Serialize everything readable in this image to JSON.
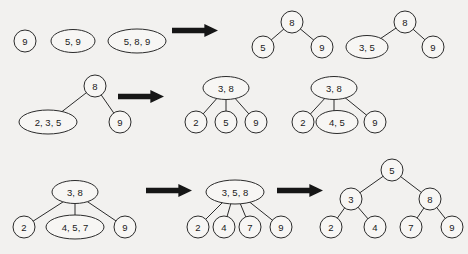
{
  "diagram": {
    "background_color": "#f2f1ef",
    "stroke_color": "#2b2b2b",
    "arrow_color": "#161616",
    "rows": [
      {
        "name": "row-1",
        "steps": [
          {
            "name": "step-1-a",
            "nodes": [
              {
                "label": "9",
                "cx": 25,
                "cy": 41,
                "rx": 11,
                "ry": 11
              }
            ],
            "edges": []
          },
          {
            "name": "step-1-b",
            "nodes": [
              {
                "label": "5, 9",
                "cx": 73,
                "cy": 41,
                "rx": 22,
                "ry": 11.5
              }
            ],
            "edges": []
          },
          {
            "name": "step-1-c",
            "nodes": [
              {
                "label": "5, 8, 9",
                "cx": 137,
                "cy": 41,
                "rx": 29,
                "ry": 12
              }
            ],
            "edges": []
          },
          {
            "name": "step-1-d",
            "nodes": [
              {
                "label": "8",
                "cx": 292,
                "cy": 22,
                "rx": 11,
                "ry": 11
              },
              {
                "label": "5",
                "cx": 263,
                "cy": 47,
                "rx": 11,
                "ry": 11
              },
              {
                "label": "9",
                "cx": 322,
                "cy": 47,
                "rx": 11,
                "ry": 11
              }
            ],
            "edges": [
              {
                "x1": 292,
                "y1": 22,
                "x2": 263,
                "y2": 47
              },
              {
                "x1": 292,
                "y1": 22,
                "x2": 322,
                "y2": 47
              }
            ]
          },
          {
            "name": "step-1-e",
            "nodes": [
              {
                "label": "8",
                "cx": 405,
                "cy": 22,
                "rx": 11,
                "ry": 11
              },
              {
                "label": "3, 5",
                "cx": 367,
                "cy": 47,
                "rx": 21,
                "ry": 11.5
              },
              {
                "label": "9",
                "cx": 433,
                "cy": 47,
                "rx": 11,
                "ry": 11
              }
            ],
            "edges": [
              {
                "x1": 405,
                "y1": 22,
                "x2": 371,
                "y2": 45
              },
              {
                "x1": 405,
                "y1": 22,
                "x2": 433,
                "y2": 47
              }
            ]
          }
        ],
        "arrows": [
          {
            "name": "arrow-row1",
            "x": 172,
            "y": 24,
            "w": 46,
            "h": 13
          }
        ]
      },
      {
        "name": "row-2",
        "steps": [
          {
            "name": "step-2-a",
            "nodes": [
              {
                "label": "8",
                "cx": 95,
                "cy": 86,
                "rx": 11,
                "ry": 11
              },
              {
                "label": "2, 3, 5",
                "cx": 48,
                "cy": 122,
                "rx": 29,
                "ry": 12
              },
              {
                "label": "9",
                "cx": 120,
                "cy": 122,
                "rx": 11,
                "ry": 11
              }
            ],
            "edges": [
              {
                "x1": 95,
                "y1": 86,
                "x2": 55,
                "y2": 117
              },
              {
                "x1": 95,
                "y1": 86,
                "x2": 120,
                "y2": 122
              }
            ]
          },
          {
            "name": "step-2-b",
            "nodes": [
              {
                "label": "3, 8",
                "cx": 226,
                "cy": 88,
                "rx": 23,
                "ry": 11.5
              },
              {
                "label": "2",
                "cx": 196,
                "cy": 122,
                "rx": 11,
                "ry": 11
              },
              {
                "label": "5",
                "cx": 226,
                "cy": 122,
                "rx": 11,
                "ry": 11
              },
              {
                "label": "9",
                "cx": 256,
                "cy": 122,
                "rx": 11,
                "ry": 11
              }
            ],
            "edges": [
              {
                "x1": 219,
                "y1": 96,
                "x2": 196,
                "y2": 122
              },
              {
                "x1": 226,
                "y1": 99,
                "x2": 226,
                "y2": 122
              },
              {
                "x1": 233,
                "y1": 96,
                "x2": 256,
                "y2": 122
              }
            ]
          },
          {
            "name": "step-2-c",
            "nodes": [
              {
                "label": "3, 8",
                "cx": 334,
                "cy": 88,
                "rx": 23,
                "ry": 11.5
              },
              {
                "label": "2",
                "cx": 303,
                "cy": 122,
                "rx": 11,
                "ry": 11
              },
              {
                "label": "4, 5",
                "cx": 337,
                "cy": 122,
                "rx": 21,
                "ry": 11.5
              },
              {
                "label": "9",
                "cx": 375,
                "cy": 122,
                "rx": 11,
                "ry": 11
              }
            ],
            "edges": [
              {
                "x1": 327,
                "y1": 96,
                "x2": 303,
                "y2": 122
              },
              {
                "x1": 334,
                "y1": 99,
                "x2": 334,
                "y2": 122
              },
              {
                "x1": 343,
                "y1": 96,
                "x2": 375,
                "y2": 122
              }
            ]
          }
        ],
        "arrows": [
          {
            "name": "arrow-row2",
            "x": 118,
            "y": 90,
            "w": 46,
            "h": 13
          }
        ]
      },
      {
        "name": "row-3",
        "steps": [
          {
            "name": "step-3-a",
            "nodes": [
              {
                "label": "3, 8",
                "cx": 75,
                "cy": 192,
                "rx": 23,
                "ry": 11.5
              },
              {
                "label": "2",
                "cx": 24,
                "cy": 227,
                "rx": 11,
                "ry": 11
              },
              {
                "label": "4, 5, 7",
                "cx": 75,
                "cy": 227,
                "rx": 29,
                "ry": 12
              },
              {
                "label": "9",
                "cx": 125,
                "cy": 227,
                "rx": 11,
                "ry": 11
              }
            ],
            "edges": [
              {
                "x1": 66,
                "y1": 200,
                "x2": 24,
                "y2": 227
              },
              {
                "x1": 75,
                "y1": 203,
                "x2": 75,
                "y2": 227
              },
              {
                "x1": 85,
                "y1": 200,
                "x2": 125,
                "y2": 227
              }
            ]
          },
          {
            "name": "step-3-b",
            "nodes": [
              {
                "label": "3, 5, 8",
                "cx": 235,
                "cy": 192,
                "rx": 29,
                "ry": 12
              },
              {
                "label": "2",
                "cx": 198,
                "cy": 227,
                "rx": 11,
                "ry": 11
              },
              {
                "label": "4",
                "cx": 224,
                "cy": 227,
                "rx": 11,
                "ry": 11
              },
              {
                "label": "7",
                "cx": 250,
                "cy": 227,
                "rx": 11,
                "ry": 11
              },
              {
                "label": "9",
                "cx": 281,
                "cy": 227,
                "rx": 11,
                "ry": 11
              }
            ],
            "edges": [
              {
                "x1": 224,
                "y1": 201,
                "x2": 198,
                "y2": 227
              },
              {
                "x1": 231,
                "y1": 203,
                "x2": 224,
                "y2": 227
              },
              {
                "x1": 240,
                "y1": 203,
                "x2": 250,
                "y2": 227
              },
              {
                "x1": 247,
                "y1": 200,
                "x2": 281,
                "y2": 227
              }
            ]
          },
          {
            "name": "step-3-c",
            "nodes": [
              {
                "label": "5",
                "cx": 392,
                "cy": 170,
                "rx": 11,
                "ry": 11
              },
              {
                "label": "3",
                "cx": 351,
                "cy": 199,
                "rx": 11,
                "ry": 11
              },
              {
                "label": "8",
                "cx": 430,
                "cy": 199,
                "rx": 11,
                "ry": 11
              },
              {
                "label": "2",
                "cx": 331,
                "cy": 227,
                "rx": 11,
                "ry": 11
              },
              {
                "label": "4",
                "cx": 375,
                "cy": 227,
                "rx": 11,
                "ry": 11
              },
              {
                "label": "7",
                "cx": 411,
                "cy": 227,
                "rx": 11,
                "ry": 11
              },
              {
                "label": "9",
                "cx": 452,
                "cy": 227,
                "rx": 11,
                "ry": 11
              }
            ],
            "edges": [
              {
                "x1": 392,
                "y1": 170,
                "x2": 351,
                "y2": 199
              },
              {
                "x1": 392,
                "y1": 170,
                "x2": 430,
                "y2": 199
              },
              {
                "x1": 351,
                "y1": 199,
                "x2": 331,
                "y2": 227
              },
              {
                "x1": 351,
                "y1": 199,
                "x2": 375,
                "y2": 227
              },
              {
                "x1": 430,
                "y1": 199,
                "x2": 411,
                "y2": 227
              },
              {
                "x1": 430,
                "y1": 199,
                "x2": 452,
                "y2": 227
              }
            ]
          }
        ],
        "arrows": [
          {
            "name": "arrow-row3-first",
            "x": 146,
            "y": 184,
            "w": 46,
            "h": 13
          },
          {
            "name": "arrow-row3-second",
            "x": 277,
            "y": 184,
            "w": 46,
            "h": 13
          }
        ]
      }
    ]
  }
}
